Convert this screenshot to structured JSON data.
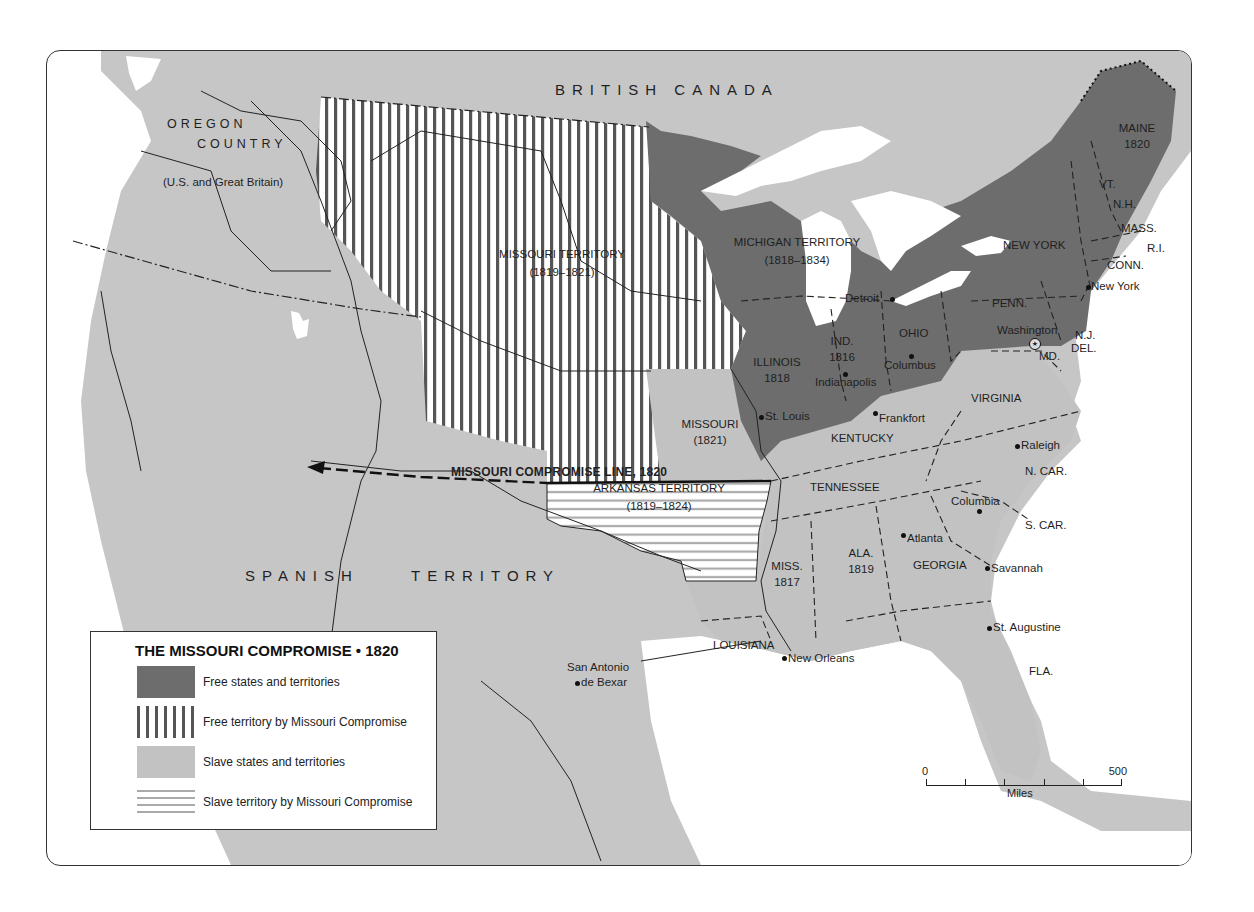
{
  "map": {
    "title": "THE MISSOURI COMPROMISE • 1820",
    "colors": {
      "free": "#6d6d6d",
      "free_by_compromise_stripe": "#555555",
      "slave": "#c2c2c2",
      "slave_by_compromise_stripe": "#aaaaaa",
      "water": "#ffffff",
      "foreign_land": "#c6c6c6",
      "border": "#333333"
    },
    "regions": {
      "british_canada": "BRITISH   CANADA",
      "oregon_line1": "OREGON",
      "oregon_line2": "COUNTRY",
      "oregon_note": "(U.S. and Great Britain)",
      "spanish": "SPANISH",
      "territory": "TERRITORY"
    },
    "territories": {
      "missouri_territory": "MISSOURI TERRITORY",
      "missouri_territory_years": "(1819–1821)",
      "michigan_territory": "MICHIGAN  TERRITORY",
      "michigan_territory_years": "(1818–1834)",
      "arkansas_territory": "ARKANSAS TERRITORY",
      "arkansas_territory_years": "(1819–1824)"
    },
    "compromise_line": "MISSOURI COMPROMISE LINE, 1820",
    "states": {
      "maine": "MAINE",
      "maine_year": "1820",
      "vt": "VT.",
      "nh": "N.H.",
      "mass": "MASS.",
      "ri": "R.I.",
      "conn": "CONN.",
      "new_york": "NEW YORK",
      "penn": "PENN.",
      "nj": "N.J.",
      "del": "DEL.",
      "md": "MD.",
      "ohio": "OHIO",
      "ind": "IND.",
      "ind_year": "1816",
      "illinois": "ILLINOIS",
      "illinois_year": "1818",
      "missouri": "MISSOURI",
      "missouri_year": "(1821)",
      "kentucky": "KENTUCKY",
      "virginia": "VIRGINIA",
      "n_car": "N. CAR.",
      "s_car": "S. CAR.",
      "tennessee": "TENNESSEE",
      "georgia": "GEORGIA",
      "ala": "ALA.",
      "ala_year": "1819",
      "miss": "MISS.",
      "miss_year": "1817",
      "louisiana": "LOUISIANA",
      "fla": "FLA."
    },
    "cities": {
      "detroit": "Detroit",
      "new_york": "New York",
      "washington": "Washington",
      "columbus": "Columbus",
      "indianapolis": "Indianapolis",
      "st_louis": "St. Louis",
      "frankfort": "Frankfort",
      "raleigh": "Raleigh",
      "columbia": "Columbia",
      "atlanta": "Atlanta",
      "savannah": "Savannah",
      "st_augustine": "St. Augustine",
      "new_orleans": "New Orleans",
      "san_antonio_1": "San Antonio",
      "san_antonio_2": "de Bexar"
    }
  },
  "legend": {
    "title": "THE MISSOURI COMPROMISE • 1820",
    "items": [
      {
        "label": "Free states and territories",
        "pattern": "solid-dark"
      },
      {
        "label": "Free territory by Missouri Compromise",
        "pattern": "vertical-stripes"
      },
      {
        "label": "Slave states and territories",
        "pattern": "solid-light"
      },
      {
        "label": "Slave territory by Missouri Compromise",
        "pattern": "horizontal-stripes"
      }
    ]
  },
  "scale": {
    "min": "0",
    "max": "500",
    "unit": "Miles"
  }
}
